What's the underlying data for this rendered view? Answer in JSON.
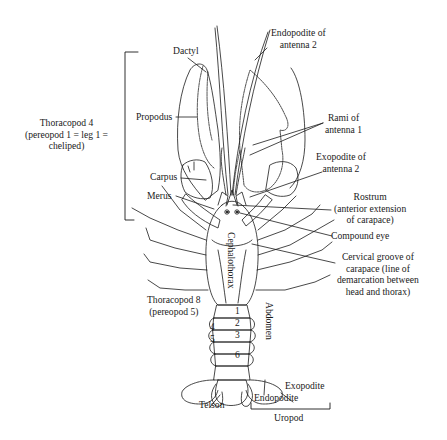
{
  "figure": {
    "line_color": "#1a1a1a",
    "background": "#ffffff"
  },
  "labels": {
    "thoracopod4": [
      "Thoracopod 4",
      "(pereopod 1 = leg 1 =",
      "cheliped)"
    ],
    "dactyl": "Dactyl",
    "propodus": "Propodus",
    "carpus": "Carpus",
    "merus": "Merus",
    "endopodite_antenna2": [
      "Endopodite of",
      "antenna 2"
    ],
    "rami_antenna1": [
      "Rami of",
      "antenna 1"
    ],
    "exopodite_antenna2": [
      "Exopodite of",
      "antenna 2"
    ],
    "rostrum": [
      "Rostrum",
      "(anterior extension",
      "of carapace)"
    ],
    "compound_eye": "Compound eye",
    "cervical_groove": [
      "Cervical groove of",
      "carapace (line of",
      "demarcation between",
      "head and thorax)"
    ],
    "cephalothorax": "Cephalothorax",
    "abdomen": "Abdomen",
    "thoracopod8": [
      "Thoracopod 8",
      "(pereopod 5)"
    ],
    "telson": "Telson",
    "endopodite": "Endopodite",
    "exopodite": "Exopodite",
    "uropod": "Uropod"
  },
  "abdominal_segments": [
    "1",
    "2",
    "3",
    "4",
    "5",
    "6"
  ]
}
